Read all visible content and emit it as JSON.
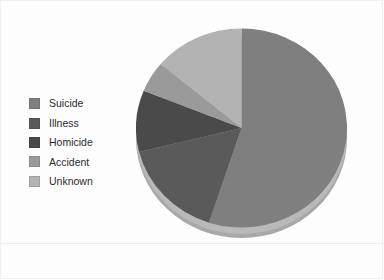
{
  "chart_data": {
    "type": "pie",
    "title": "",
    "subtitle": "",
    "xlabel": "",
    "ylabel": "",
    "grid": false,
    "legend_position": "left",
    "three_d": true,
    "start_angle_deg": 0,
    "direction": "clockwise",
    "categories": [
      "Suicide",
      "Illness",
      "Homicide",
      "Accident",
      "Unknown"
    ],
    "values": [
      55,
      16,
      10,
      5,
      14
    ],
    "colors": [
      "#7f7f7f",
      "#5a5a5a",
      "#4a4a4a",
      "#9a9a9a",
      "#b3b3b3"
    ],
    "slices": [
      {
        "label": "Suicide",
        "value": 55,
        "color": "#7f7f7f",
        "start_deg": 0,
        "end_deg": 198
      },
      {
        "label": "Illness",
        "value": 16,
        "color": "#5a5a5a",
        "start_deg": 198,
        "end_deg": 256
      },
      {
        "label": "Homicide",
        "value": 10,
        "color": "#4a4a4a",
        "start_deg": 256,
        "end_deg": 292
      },
      {
        "label": "Accident",
        "value": 5,
        "color": "#9a9a9a",
        "start_deg": 292,
        "end_deg": 310
      },
      {
        "label": "Unknown",
        "value": 14,
        "color": "#b3b3b3",
        "start_deg": 310,
        "end_deg": 360
      }
    ]
  },
  "legend": {
    "items": [
      {
        "label": "Suicide",
        "color": "#7f7f7f"
      },
      {
        "label": "Illness",
        "color": "#5a5a5a"
      },
      {
        "label": "Homicide",
        "color": "#4a4a4a"
      },
      {
        "label": "Accident",
        "color": "#9a9a9a"
      },
      {
        "label": "Unknown",
        "color": "#b3b3b3"
      }
    ]
  },
  "figure": {
    "background": "#fdfdfd",
    "base_color": "#b9b9b9",
    "base_shade_color": "#a8a8a8"
  }
}
